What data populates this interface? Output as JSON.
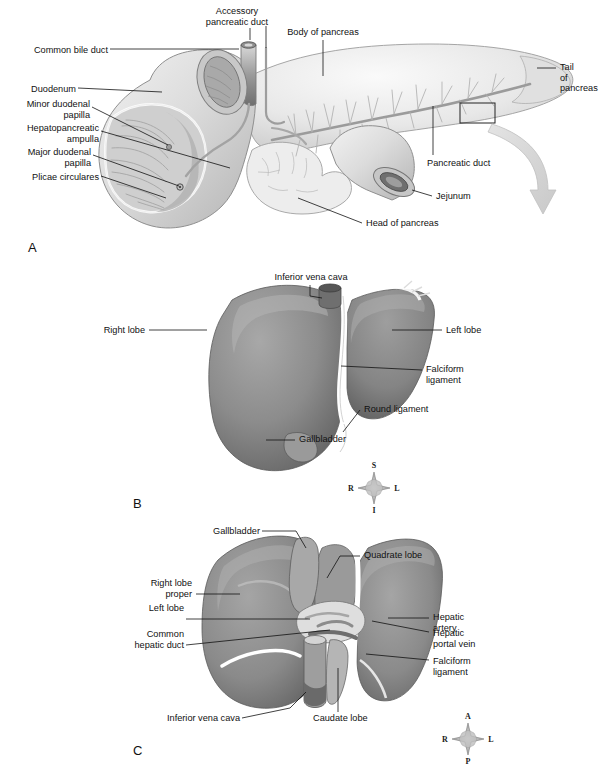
{
  "figure": {
    "background": "#ffffff",
    "ink": "#111111",
    "organ_light": "#e9e9e9",
    "organ_mid": "#8d8d8d",
    "organ_dark": "#5e5e5e",
    "arrow_color": "#d6d6d6"
  },
  "panels": [
    {
      "letter": "A",
      "name": "pancreas-duodenum",
      "labels": [
        {
          "text": "Accessory\npancreatic duct",
          "align": "center",
          "x": 237,
          "y": 6
        },
        {
          "text": "Body of pancreas",
          "align": "center",
          "x": 323,
          "y": 27
        },
        {
          "text": "Common bile duct",
          "align": "right",
          "x": 12,
          "y": 45
        },
        {
          "text": "Duodenum",
          "align": "right",
          "x": 12,
          "y": 84
        },
        {
          "text": "Minor duodenal\npapilla",
          "align": "right",
          "x": 12,
          "y": 99
        },
        {
          "text": "Hepatopancreatic\nampulla",
          "align": "right",
          "x": 12,
          "y": 123
        },
        {
          "text": "Major duodenal\npapilla",
          "align": "right",
          "x": 12,
          "y": 147
        },
        {
          "text": "Plicae circulares",
          "align": "right",
          "x": 12,
          "y": 172
        },
        {
          "text": "Tail\nof\npancreas",
          "align": "left",
          "x": 558,
          "y": 64
        },
        {
          "text": "Pancreatic duct",
          "align": "left",
          "x": 427,
          "y": 158
        },
        {
          "text": "Jejunum",
          "align": "left",
          "x": 434,
          "y": 192
        },
        {
          "text": "Head of pancreas",
          "align": "left",
          "x": 364,
          "y": 219
        }
      ]
    },
    {
      "letter": "B",
      "name": "liver-anterior-view",
      "labels": [
        {
          "text": "Inferior vena cava",
          "align": "center",
          "x": 310,
          "y": 273
        },
        {
          "text": "Right lobe",
          "align": "right",
          "x": 88,
          "y": 325
        },
        {
          "text": "Left lobe",
          "align": "left",
          "x": 444,
          "y": 325
        },
        {
          "text": "Falciform\nligament",
          "align": "left",
          "x": 424,
          "y": 364
        },
        {
          "text": "Round ligament",
          "align": "left",
          "x": 362,
          "y": 406
        },
        {
          "text": "Gallbladder",
          "align": "left",
          "x": 297,
          "y": 435
        }
      ],
      "compass": {
        "top": "S",
        "bottom": "I",
        "left": "R",
        "right": "L",
        "cx": 374,
        "cy": 488
      }
    },
    {
      "letter": "C",
      "name": "liver-inferior-view",
      "labels": [
        {
          "text": "Gallbladder",
          "align": "right",
          "x": 196,
          "y": 527
        },
        {
          "text": "Quadrate lobe",
          "align": "left",
          "x": 362,
          "y": 551
        },
        {
          "text": "Right lobe\nproper",
          "align": "right",
          "x": 132,
          "y": 579
        },
        {
          "text": "Left lobe",
          "align": "left",
          "x": 431,
          "y": 613
        },
        {
          "text": "Common\nhepatic duct",
          "align": "right",
          "x": 106,
          "y": 604
        },
        {
          "text": "Hepatic\nartery",
          "align": "left",
          "x": 431,
          "y": 629
        },
        {
          "text": "Hepatic\nportal vein",
          "align": "right",
          "x": 106,
          "y": 631
        },
        {
          "text": "Falciform\nligament",
          "align": "left",
          "x": 431,
          "y": 657
        },
        {
          "text": "Inferior vena cava",
          "align": "right",
          "x": 172,
          "y": 714
        },
        {
          "text": "Caudate lobe",
          "align": "left",
          "x": 311,
          "y": 714
        }
      ],
      "compass": {
        "top": "A",
        "bottom": "P",
        "left": "R",
        "right": "L",
        "cx": 468,
        "cy": 739
      }
    }
  ],
  "panel_letters": [
    {
      "label": "A",
      "x": 28,
      "y": 240
    },
    {
      "label": "B",
      "x": 133,
      "y": 496
    },
    {
      "label": "C",
      "x": 133,
      "y": 743
    }
  ]
}
